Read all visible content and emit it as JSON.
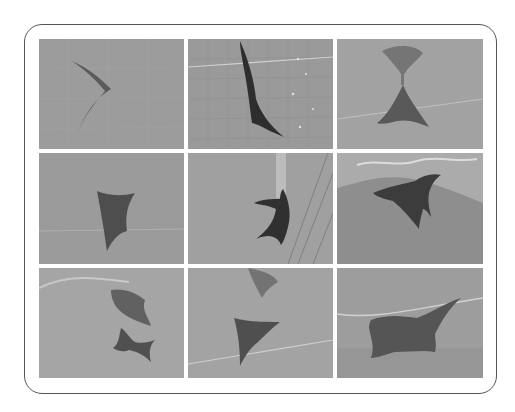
{
  "figure": {
    "rows": 3,
    "columns": 3,
    "frame_color": "#555555",
    "background": "#ffffff",
    "tiles": [
      {
        "row": 1,
        "col": 1,
        "subject": "ray side view facing right, wings swept back",
        "bg": "#9c9c9c",
        "subject_color": "#5a5a5a"
      },
      {
        "row": 1,
        "col": 2,
        "subject": "ray vertical, dark, over tiled pool wall with bubbles",
        "bg": "#9a9a9a",
        "subject_color": "#2e2e2e"
      },
      {
        "row": 1,
        "col": 3,
        "subject": "ray below with bubble trail/shadow above",
        "bg": "#a2a2a2",
        "subject_color": "#595959"
      },
      {
        "row": 2,
        "col": 1,
        "subject": "ray from below, broad wings",
        "bg": "#9b9b9b",
        "subject_color": "#4e4e4e"
      },
      {
        "row": 2,
        "col": 2,
        "subject": "ray near wall with bright streak above",
        "bg": "#a0a0a0",
        "subject_color": "#303030"
      },
      {
        "row": 2,
        "col": 3,
        "subject": "ray gliding under turbulent surface water",
        "bg": "#8e8e8e",
        "subject_color": "#3c3c3c"
      },
      {
        "row": 3,
        "col": 1,
        "subject": "small ray below its reflection/shadow",
        "bg": "#a5a5a5",
        "subject_color": "#505050"
      },
      {
        "row": 3,
        "col": 2,
        "subject": "ray triangle shape with shadow above",
        "bg": "#a3a3a3",
        "subject_color": "#4f4f4f"
      },
      {
        "row": 3,
        "col": 3,
        "subject": "ray seen from below, wide wingspan",
        "bg": "#9d9d9d",
        "subject_color": "#555555"
      }
    ]
  }
}
